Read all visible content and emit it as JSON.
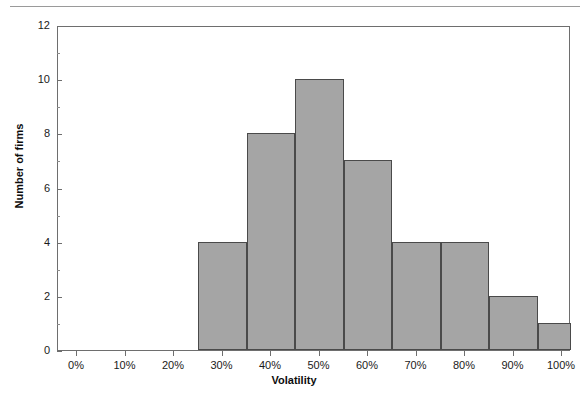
{
  "figure": {
    "background_color": "#ffffff",
    "rule_color": "#9a9a9a",
    "axis_color": "#6e6e6e",
    "bar_fill_color": "#a5a5a5",
    "bar_border_color": "#4a4a4a"
  },
  "chart_data": {
    "type": "bar",
    "title": "",
    "subtitle": "",
    "xlabel": "Volatility",
    "ylabel": "Number of firms",
    "categories": [
      "25%",
      "35%",
      "45%",
      "55%",
      "65%",
      "75%",
      "85%",
      "95%"
    ],
    "bin_edges": [
      "25%",
      "35%",
      "45%",
      "55%",
      "65%",
      "75%",
      "85%",
      "95%",
      "105%"
    ],
    "values": [
      4,
      8,
      10,
      7,
      4,
      4,
      2,
      1
    ],
    "xlim": [
      "-5%",
      "100%"
    ],
    "ylim": [
      0,
      12
    ],
    "x_tick_labels": [
      "0%",
      "10%",
      "20%",
      "30%",
      "40%",
      "50%",
      "60%",
      "70%",
      "80%",
      "90%",
      "100%"
    ],
    "x_tick_values": [
      0,
      10,
      20,
      30,
      40,
      50,
      60,
      70,
      80,
      90,
      100
    ],
    "y_tick_labels": [
      "0",
      "2",
      "4",
      "6",
      "8",
      "10",
      "12"
    ],
    "y_tick_values": [
      0,
      2,
      4,
      6,
      8,
      10,
      12
    ],
    "grid": false,
    "legend": null,
    "legend_position": "none",
    "annotations": []
  }
}
